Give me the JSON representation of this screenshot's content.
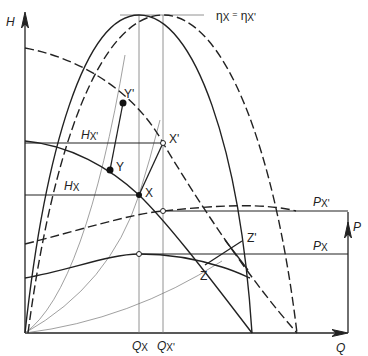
{
  "diagram": {
    "type": "pump characteristic diagram",
    "axes": {
      "left_axis_label": "H",
      "bottom_axis_label": "Q",
      "right_axis_label": "P"
    },
    "efficiency_label": {
      "eta": "η",
      "sub1": "X",
      "eq": "=",
      "eta2": "η",
      "sub2": "X'"
    },
    "head_labels": {
      "hx_prime": {
        "main": "H",
        "sub": "X'"
      },
      "hx": {
        "main": "H",
        "sub": "X"
      }
    },
    "power_labels": {
      "px_prime": {
        "main": "P",
        "sub": "X'"
      },
      "px": {
        "main": "P",
        "sub": "X"
      }
    },
    "flow_labels": {
      "qx": {
        "main": "Q",
        "sub": "X"
      },
      "qx_prime": {
        "main": "Q",
        "sub": "X'"
      }
    },
    "points": [
      {
        "name": "X",
        "label": "X"
      },
      {
        "name": "X'",
        "label": "X'"
      },
      {
        "name": "Y",
        "label": "Y"
      },
      {
        "name": "Y'",
        "label": "Y'"
      },
      {
        "name": "Z",
        "label": "Z"
      },
      {
        "name": "Z'",
        "label": "Z'"
      }
    ],
    "colors": {
      "line": "#222222",
      "thin_line": "#666666",
      "background": "#ffffff"
    }
  }
}
